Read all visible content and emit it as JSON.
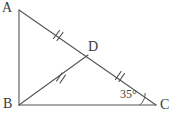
{
  "figure": {
    "type": "geometry-diagram",
    "background_color": "#ffffff",
    "stroke_color": "#555555",
    "text_color": "#3a3a3a",
    "width": 173,
    "height": 119
  },
  "labels": {
    "A": "A",
    "B": "B",
    "C": "C",
    "D": "D",
    "angle_C": "35°"
  },
  "points": {
    "A": {
      "x": 19,
      "y": 10
    },
    "B": {
      "x": 19,
      "y": 105
    },
    "C": {
      "x": 156,
      "y": 105
    },
    "D": {
      "x": 88,
      "y": 55
    }
  },
  "segments": [
    {
      "name": "AB",
      "from": "A",
      "to": "B",
      "ticks": 0
    },
    {
      "name": "BC",
      "from": "B",
      "to": "C",
      "ticks": 0
    },
    {
      "name": "AD",
      "from": "A",
      "to": "D",
      "ticks": 2
    },
    {
      "name": "DC",
      "from": "D",
      "to": "C",
      "ticks": 2
    },
    {
      "name": "BD",
      "from": "B",
      "to": "D",
      "ticks": 2
    }
  ],
  "angles": [
    {
      "at": "C",
      "value": "35°",
      "arc": true
    }
  ],
  "tick_marks": {
    "style": "double-slash",
    "positions": [
      {
        "segment": "AD",
        "x": 57,
        "y": 35
      },
      {
        "segment": "BD",
        "x": 60,
        "y": 77
      },
      {
        "segment": "DC",
        "x": 119,
        "y": 76
      }
    ]
  }
}
